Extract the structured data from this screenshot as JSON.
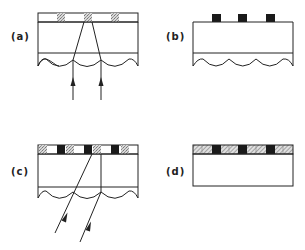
{
  "figure": {
    "panels": [
      {
        "id": "a",
        "label": "(a)",
        "description": "Lenticular screen with sparse color filter strip; two vertical light rays converge through lens apices onto center filter element"
      },
      {
        "id": "b",
        "label": "(b)",
        "description": "Lenticular screen with three black masking elements above substrate"
      },
      {
        "id": "c",
        "label": "(c)",
        "description": "Lenticular screen with full color filter stripe; two oblique rays pass through lenses to filter elements"
      },
      {
        "id": "d",
        "label": "(d)",
        "description": "Flat substrate with full hatched color filter stripe and black matrix"
      }
    ],
    "colors": {
      "line": "#222222",
      "black_element": "#1a1a1a",
      "stipple": "#bdbdbd",
      "hatch": "#9a9a9a",
      "background": "#ffffff"
    }
  }
}
